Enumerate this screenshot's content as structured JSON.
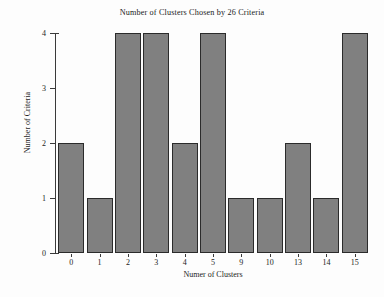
{
  "chart_data": {
    "type": "bar",
    "title": "Number of Clusters Chosen by 26 Criteria",
    "xlabel": "Numer of Clusters",
    "ylabel": "Number of Criteria",
    "categories": [
      "0",
      "1",
      "2",
      "3",
      "4",
      "5",
      "9",
      "10",
      "13",
      "14",
      "15"
    ],
    "values": [
      2,
      1,
      4,
      4,
      2,
      4,
      1,
      1,
      2,
      1,
      4
    ],
    "ytick_labels": [
      "0",
      "1",
      "2",
      "3",
      "4"
    ],
    "ytick_values": [
      0,
      1,
      2,
      3,
      4
    ],
    "ylim": [
      0,
      4
    ],
    "grid": false,
    "legend": null,
    "bar_color": "#808080",
    "bar_edge_color": "#2b2b2b",
    "axis_color": "#3a3a3a",
    "background_color": "#fdfdfd"
  }
}
